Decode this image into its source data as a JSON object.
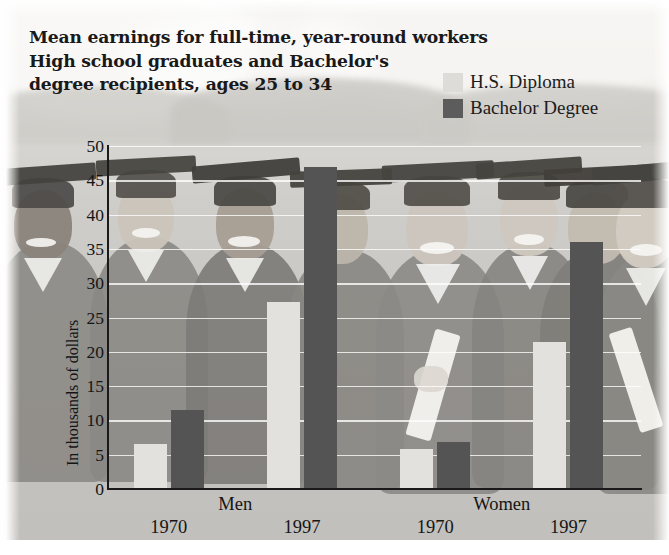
{
  "title": {
    "lines": [
      "Mean earnings for full-time, year-round workers",
      "High school graduates and Bachelor's",
      "degree recipients, ages 25 to 34"
    ]
  },
  "legend": {
    "items": [
      {
        "label": "H.S. Diploma",
        "color": "#dedcd9",
        "swatch_name": "legend-swatch-hs-diploma"
      },
      {
        "label": "Bachelor Degree",
        "color": "#5c5c5c",
        "swatch_name": "legend-swatch-bachelor-degree"
      }
    ]
  },
  "axes": {
    "y_title": "In thousands of dollars",
    "y_ticks": [
      "50",
      "45",
      "40",
      "35",
      "30",
      "25",
      "20",
      "15",
      "10",
      "5",
      "0"
    ],
    "groups": [
      {
        "name": "Men",
        "years": [
          "1970",
          "1997"
        ]
      },
      {
        "name": "Women",
        "years": [
          "1970",
          "1997"
        ]
      }
    ]
  },
  "background": {
    "description": "faded photograph of graduates in caps and gowns holding diplomas"
  },
  "chart_data": {
    "type": "bar",
    "title": "Mean earnings for full-time, year-round workers High school graduates and Bachelor's degree recipients, ages 25 to 34",
    "xlabel": "",
    "ylabel": "In thousands of dollars",
    "ylim": [
      0,
      50
    ],
    "ytick_step": 5,
    "grid": true,
    "legend_position": "top-right",
    "categories": [
      "Men 1970",
      "Men 1997",
      "Women 1970",
      "Women 1997"
    ],
    "series": [
      {
        "name": "H.S. Diploma",
        "color": "#dedcd9",
        "values": [
          6.6,
          27.2,
          5.9,
          21.5
        ]
      },
      {
        "name": "Bachelor Degree",
        "color": "#5c5c5c",
        "values": [
          11.5,
          47.0,
          6.8,
          36.0
        ]
      }
    ]
  }
}
